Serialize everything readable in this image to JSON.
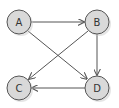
{
  "diagram": {
    "type": "directed-graph",
    "nodes": [
      {
        "id": "A",
        "label": "A",
        "cx": 19,
        "cy": 22
      },
      {
        "id": "B",
        "label": "B",
        "cx": 97,
        "cy": 22
      },
      {
        "id": "C",
        "label": "C",
        "cx": 19,
        "cy": 88
      },
      {
        "id": "D",
        "label": "D",
        "cx": 97,
        "cy": 88
      }
    ],
    "edges": [
      {
        "from": "A",
        "to": "B"
      },
      {
        "from": "A",
        "to": "D"
      },
      {
        "from": "B",
        "to": "C"
      },
      {
        "from": "B",
        "to": "D"
      },
      {
        "from": "D",
        "to": "C"
      }
    ],
    "colors": {
      "node_fill": "#d9d9d9",
      "node_stroke": "#555555",
      "edge": "#555555",
      "shadow": "#cccccc"
    }
  }
}
